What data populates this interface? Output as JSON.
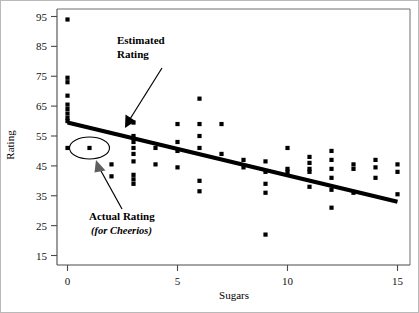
{
  "chart_data": {
    "type": "scatter",
    "title": "",
    "xlabel": "Sugars",
    "ylabel": "Rating",
    "xlim": [
      -0.6,
      15.6
    ],
    "ylim": [
      13,
      97
    ],
    "x_ticks": [
      0,
      5,
      10,
      15
    ],
    "x_tick_labels": [
      "0",
      "5",
      "10",
      "15"
    ],
    "y_ticks": [
      15,
      25,
      35,
      45,
      55,
      65,
      75,
      85,
      95
    ],
    "y_tick_labels": [
      "15",
      "25",
      "35",
      "45",
      "55",
      "65",
      "75",
      "85",
      "95"
    ],
    "grid": false,
    "legend": "none",
    "points": [
      [
        0,
        94
      ],
      [
        0,
        74.5
      ],
      [
        0,
        73
      ],
      [
        0,
        68.5
      ],
      [
        0,
        65.5
      ],
      [
        0,
        64
      ],
      [
        0,
        62.5
      ],
      [
        0,
        61
      ],
      [
        0,
        60
      ],
      [
        0,
        51
      ],
      [
        1,
        51
      ],
      [
        2,
        45.5
      ],
      [
        2,
        41.5
      ],
      [
        3,
        59.5
      ],
      [
        3,
        55
      ],
      [
        3,
        53
      ],
      [
        3,
        51
      ],
      [
        3,
        49
      ],
      [
        3,
        46.5
      ],
      [
        3,
        42
      ],
      [
        3,
        40.5
      ],
      [
        3,
        39
      ],
      [
        4,
        51
      ],
      [
        4,
        45.5
      ],
      [
        5,
        59
      ],
      [
        5,
        53
      ],
      [
        5,
        50
      ],
      [
        5,
        44.5
      ],
      [
        6,
        67.5
      ],
      [
        6,
        59
      ],
      [
        6,
        55
      ],
      [
        6,
        51
      ],
      [
        6,
        40
      ],
      [
        6,
        36.5
      ],
      [
        7,
        59
      ],
      [
        7,
        49
      ],
      [
        8,
        47
      ],
      [
        8,
        44.5
      ],
      [
        9,
        46.5
      ],
      [
        9,
        43
      ],
      [
        9,
        39
      ],
      [
        9,
        36
      ],
      [
        9,
        22
      ],
      [
        10,
        51
      ],
      [
        10,
        44
      ],
      [
        10,
        43
      ],
      [
        11,
        48
      ],
      [
        11,
        46
      ],
      [
        11,
        44
      ],
      [
        11,
        43
      ],
      [
        11,
        38
      ],
      [
        12,
        50
      ],
      [
        12,
        47
      ],
      [
        12,
        44
      ],
      [
        12,
        41
      ],
      [
        12,
        37
      ],
      [
        12,
        31
      ],
      [
        13,
        45.5
      ],
      [
        13,
        44
      ],
      [
        13,
        36
      ],
      [
        14,
        47
      ],
      [
        14,
        44.5
      ],
      [
        14,
        41
      ],
      [
        15,
        45.5
      ],
      [
        15,
        43
      ],
      [
        15,
        35.5
      ]
    ],
    "fit_line": {
      "label": "Estimated Rating",
      "x1": 0.0,
      "y1": 59.5,
      "x2": 15.0,
      "y2": 33.0
    },
    "highlight": {
      "label": "Actual Rating",
      "sublabel": "(for Cheerios)",
      "x": 1.0,
      "y": 51.0
    }
  },
  "annotations": {
    "estimated": {
      "line1": "Estimated",
      "line2": "Rating"
    },
    "actual": {
      "line1": "Actual Rating",
      "line2": "(for Cheerios)"
    }
  },
  "axes": {
    "x_title": "Sugars",
    "y_title": "Rating"
  }
}
